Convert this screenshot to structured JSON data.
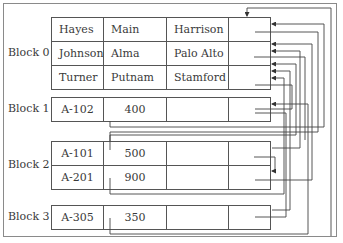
{
  "diagram": {
    "title": "",
    "blocks": [
      {
        "label": "Block 0",
        "records": [
          {
            "c1": "Hayes",
            "c2": "Main",
            "c3": "Harrison",
            "c4": ""
          },
          {
            "c1": "Johnson",
            "c2": "Alma",
            "c3": "Palo Alto",
            "c4": ""
          },
          {
            "c1": "Turner",
            "c2": "Putnam",
            "c3": "Stamford",
            "c4": ""
          }
        ]
      },
      {
        "label": "Block 1",
        "records": [
          {
            "c1": "A-102",
            "c2": "400",
            "c3": "",
            "c4": ""
          }
        ]
      },
      {
        "label": "Block 2",
        "records": [
          {
            "c1": "A-101",
            "c2": "500",
            "c3": "",
            "c4": ""
          },
          {
            "c1": "A-201",
            "c2": "900",
            "c3": "",
            "c4": ""
          }
        ]
      },
      {
        "label": "Block 3",
        "records": [
          {
            "c1": "A-305",
            "c2": "350",
            "c3": "",
            "c4": ""
          }
        ]
      }
    ],
    "colors": {
      "line": "#444444",
      "frame": "#8a8a8a",
      "text": "#3a3a3a"
    }
  }
}
